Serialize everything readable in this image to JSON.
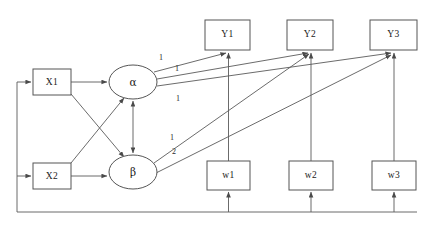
{
  "diagram": {
    "nodes": {
      "x1": {
        "label": "X1",
        "shape": "rect",
        "x": 33,
        "y": 69,
        "w": 38,
        "h": 26
      },
      "x2": {
        "label": "X2",
        "shape": "rect",
        "x": 33,
        "y": 163,
        "w": 38,
        "h": 26
      },
      "alpha": {
        "label": "α",
        "shape": "ellipse",
        "cx": 133,
        "cy": 82,
        "rx": 24,
        "ry": 17
      },
      "beta": {
        "label": "β",
        "shape": "ellipse",
        "cx": 133,
        "cy": 172,
        "rx": 24,
        "ry": 17
      },
      "y1": {
        "label": "Y1",
        "shape": "rect",
        "x": 205,
        "y": 20,
        "w": 45,
        "h": 30
      },
      "y2": {
        "label": "Y2",
        "shape": "rect",
        "x": 287,
        "y": 20,
        "w": 46,
        "h": 30
      },
      "y3": {
        "label": "Y3",
        "shape": "rect",
        "x": 370,
        "y": 20,
        "w": 47,
        "h": 30
      },
      "w1": {
        "label": "w1",
        "shape": "rect",
        "x": 207,
        "y": 161,
        "w": 43,
        "h": 29
      },
      "w2": {
        "label": "w2",
        "shape": "rect",
        "x": 289,
        "y": 161,
        "w": 44,
        "h": 29
      },
      "w3": {
        "label": "w3",
        "shape": "rect",
        "x": 372,
        "y": 161,
        "w": 44,
        "h": 29
      }
    },
    "coefficients": [
      {
        "id": "alpha-y1",
        "value": "1",
        "x": 161,
        "y": 58
      },
      {
        "id": "alpha-y2",
        "value": "1",
        "x": 177,
        "y": 69
      },
      {
        "id": "alpha-y3",
        "value": "1",
        "x": 178,
        "y": 99
      },
      {
        "id": "beta-y2",
        "value": "1",
        "x": 172,
        "y": 138
      },
      {
        "id": "beta-y3",
        "value": "2",
        "x": 174,
        "y": 152
      }
    ],
    "colors": {
      "stroke": "#5a5a5a",
      "box_stroke": "#555555",
      "text": "#1a1a1a",
      "background": "#ffffff"
    }
  }
}
